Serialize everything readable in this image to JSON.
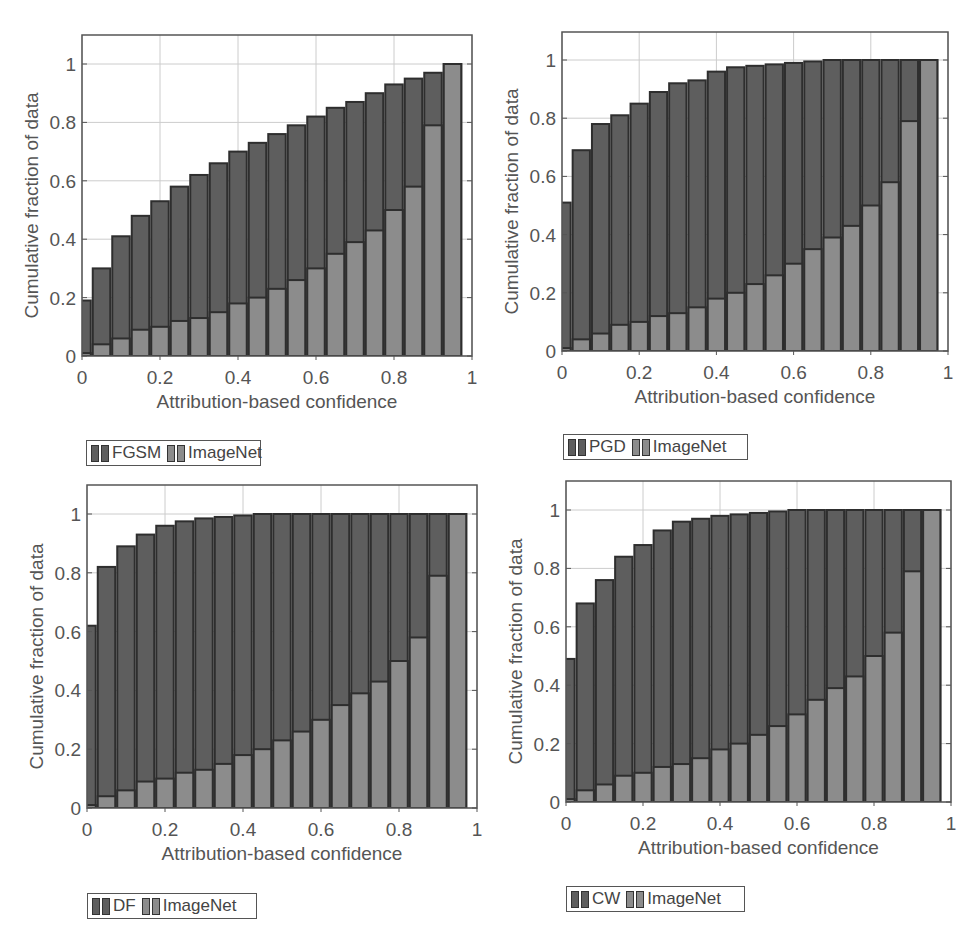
{
  "colors": {
    "adversarial_fill": "#5e5e5e",
    "imagenet_fill": "#8c8c8c",
    "bar_edge": "#2e2e2e",
    "grid": "#cccccc",
    "axis": "#555555"
  },
  "chart_data": [
    {
      "type": "bar",
      "title": "",
      "xlabel": "Attribution-based confidence",
      "ylabel": "Cumulative fraction of data",
      "xlim": [
        0,
        1
      ],
      "ylim": [
        0,
        1.1
      ],
      "grid": true,
      "legend_position": "below",
      "xticks": [
        "0",
        "0.2",
        "0.4",
        "0.6",
        "0.8",
        "1"
      ],
      "yticks": [
        "0",
        "0.2",
        "0.4",
        "0.6",
        "0.8",
        "1"
      ],
      "bin_width": 0.05,
      "x": [
        0,
        0.05,
        0.1,
        0.15,
        0.2,
        0.25,
        0.3,
        0.35,
        0.4,
        0.45,
        0.5,
        0.55,
        0.6,
        0.65,
        0.7,
        0.75,
        0.8,
        0.85,
        0.9,
        0.95
      ],
      "series": [
        {
          "name": "FGSM",
          "values": [
            0.19,
            0.3,
            0.41,
            0.48,
            0.53,
            0.58,
            0.62,
            0.66,
            0.7,
            0.73,
            0.76,
            0.79,
            0.82,
            0.85,
            0.87,
            0.9,
            0.93,
            0.95,
            0.97,
            1.0
          ]
        },
        {
          "name": "ImageNet",
          "values": [
            0.01,
            0.04,
            0.06,
            0.09,
            0.1,
            0.12,
            0.13,
            0.15,
            0.18,
            0.2,
            0.23,
            0.26,
            0.3,
            0.35,
            0.39,
            0.43,
            0.5,
            0.58,
            0.79,
            1.0
          ]
        }
      ],
      "legend": [
        "FGSM",
        "ImageNet"
      ]
    },
    {
      "type": "bar",
      "title": "",
      "xlabel": "Attribution-based confidence",
      "ylabel": "Cumulative fraction of data",
      "xlim": [
        0,
        1
      ],
      "ylim": [
        0,
        1.1
      ],
      "grid": true,
      "legend_position": "below",
      "xticks": [
        "0",
        "0.2",
        "0.4",
        "0.6",
        "0.8",
        "1"
      ],
      "yticks": [
        "0",
        "0.2",
        "0.4",
        "0.6",
        "0.8",
        "1"
      ],
      "bin_width": 0.05,
      "x": [
        0,
        0.05,
        0.1,
        0.15,
        0.2,
        0.25,
        0.3,
        0.35,
        0.4,
        0.45,
        0.5,
        0.55,
        0.6,
        0.65,
        0.7,
        0.75,
        0.8,
        0.85,
        0.9,
        0.95
      ],
      "series": [
        {
          "name": "PGD",
          "values": [
            0.51,
            0.69,
            0.78,
            0.81,
            0.85,
            0.89,
            0.92,
            0.93,
            0.96,
            0.975,
            0.98,
            0.985,
            0.99,
            0.995,
            1.0,
            1.0,
            1.0,
            1.0,
            1.0,
            1.0
          ]
        },
        {
          "name": "ImageNet",
          "values": [
            0.01,
            0.04,
            0.06,
            0.09,
            0.1,
            0.12,
            0.13,
            0.15,
            0.18,
            0.2,
            0.23,
            0.26,
            0.3,
            0.35,
            0.39,
            0.43,
            0.5,
            0.58,
            0.79,
            1.0
          ]
        }
      ],
      "legend": [
        "PGD",
        "ImageNet"
      ]
    },
    {
      "type": "bar",
      "title": "",
      "xlabel": "Attribution-based confidence",
      "ylabel": "Cumulative fraction of data",
      "xlim": [
        0,
        1
      ],
      "ylim": [
        0,
        1.1
      ],
      "grid": true,
      "legend_position": "below",
      "xticks": [
        "0",
        "0.2",
        "0.4",
        "0.6",
        "0.8",
        "1"
      ],
      "yticks": [
        "0",
        "0.2",
        "0.4",
        "0.6",
        "0.8",
        "1"
      ],
      "bin_width": 0.05,
      "x": [
        0,
        0.05,
        0.1,
        0.15,
        0.2,
        0.25,
        0.3,
        0.35,
        0.4,
        0.45,
        0.5,
        0.55,
        0.6,
        0.65,
        0.7,
        0.75,
        0.8,
        0.85,
        0.9,
        0.95
      ],
      "series": [
        {
          "name": "DF",
          "values": [
            0.62,
            0.82,
            0.89,
            0.93,
            0.96,
            0.975,
            0.985,
            0.99,
            0.995,
            1.0,
            1.0,
            1.0,
            1.0,
            1.0,
            1.0,
            1.0,
            1.0,
            1.0,
            1.0,
            1.0
          ]
        },
        {
          "name": "ImageNet",
          "values": [
            0.01,
            0.04,
            0.06,
            0.09,
            0.1,
            0.12,
            0.13,
            0.15,
            0.18,
            0.2,
            0.23,
            0.26,
            0.3,
            0.35,
            0.39,
            0.43,
            0.5,
            0.58,
            0.79,
            1.0
          ]
        }
      ],
      "legend": [
        "DF",
        "ImageNet"
      ]
    },
    {
      "type": "bar",
      "title": "",
      "xlabel": "Attribution-based confidence",
      "ylabel": "Cumulative fraction of data",
      "xlim": [
        0,
        1
      ],
      "ylim": [
        0,
        1.1
      ],
      "grid": true,
      "legend_position": "below",
      "xticks": [
        "0",
        "0.2",
        "0.4",
        "0.6",
        "0.8",
        "1"
      ],
      "yticks": [
        "0",
        "0.2",
        "0.4",
        "0.6",
        "0.8",
        "1"
      ],
      "bin_width": 0.05,
      "x": [
        0,
        0.05,
        0.1,
        0.15,
        0.2,
        0.25,
        0.3,
        0.35,
        0.4,
        0.45,
        0.5,
        0.55,
        0.6,
        0.65,
        0.7,
        0.75,
        0.8,
        0.85,
        0.9,
        0.95
      ],
      "series": [
        {
          "name": "CW",
          "values": [
            0.49,
            0.68,
            0.76,
            0.84,
            0.88,
            0.93,
            0.96,
            0.97,
            0.98,
            0.985,
            0.99,
            0.995,
            1.0,
            1.0,
            1.0,
            1.0,
            1.0,
            1.0,
            1.0,
            1.0
          ]
        },
        {
          "name": "ImageNet",
          "values": [
            0.01,
            0.04,
            0.06,
            0.09,
            0.1,
            0.12,
            0.13,
            0.15,
            0.18,
            0.2,
            0.23,
            0.26,
            0.3,
            0.35,
            0.39,
            0.43,
            0.5,
            0.58,
            0.79,
            1.0
          ]
        }
      ],
      "legend": [
        "CW",
        "ImageNet"
      ]
    }
  ],
  "layout": [
    {
      "name": "chart-fgsm",
      "x0": 82,
      "x1": 472,
      "yTop": 35,
      "yOne": 64,
      "yZero": 356,
      "legend": {
        "left": 86,
        "top": 440,
        "width": 175
      }
    },
    {
      "name": "chart-pgd",
      "x0": 562,
      "x1": 948,
      "yTop": 32,
      "yOne": 60,
      "yZero": 351,
      "legend": {
        "left": 563,
        "top": 434,
        "width": 185
      }
    },
    {
      "name": "chart-df",
      "x0": 87,
      "x1": 477,
      "yTop": 485,
      "yOne": 514,
      "yZero": 808,
      "legend": {
        "left": 87,
        "top": 893,
        "width": 170
      }
    },
    {
      "name": "chart-cw",
      "x0": 566,
      "x1": 951,
      "yTop": 481,
      "yOne": 510,
      "yZero": 802,
      "legend": {
        "left": 566,
        "top": 886,
        "width": 179
      }
    }
  ]
}
